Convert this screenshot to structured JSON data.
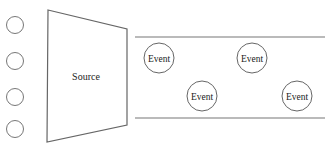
{
  "diagram": {
    "type": "event-stream",
    "source": {
      "label": "Source",
      "shape": "trapezoid",
      "points": [
        [
          48,
          10
        ],
        [
          127,
          29
        ],
        [
          127,
          125
        ],
        [
          47,
          142
        ]
      ]
    },
    "inputs": [
      {
        "cx": 15,
        "cy": 25,
        "r": 8.5
      },
      {
        "cx": 15,
        "cy": 61,
        "r": 8.5
      },
      {
        "cx": 15,
        "cy": 97,
        "r": 8.5
      },
      {
        "cx": 15,
        "cy": 129,
        "r": 8.5
      }
    ],
    "stream": {
      "top_line": {
        "x1": 135,
        "x2": 325,
        "y": 37
      },
      "bottom_line": {
        "x1": 135,
        "x2": 325,
        "y": 118
      }
    },
    "events": [
      {
        "label": "Event",
        "cx": 159,
        "cy": 58,
        "r": 15
      },
      {
        "label": "Event",
        "cx": 252,
        "cy": 58,
        "r": 15
      },
      {
        "label": "Event",
        "cx": 202,
        "cy": 96,
        "r": 15
      },
      {
        "label": "Event",
        "cx": 297,
        "cy": 96,
        "r": 15
      }
    ],
    "colors": {
      "stroke": "#666666",
      "text": "#222222",
      "background": "#ffffff"
    }
  }
}
